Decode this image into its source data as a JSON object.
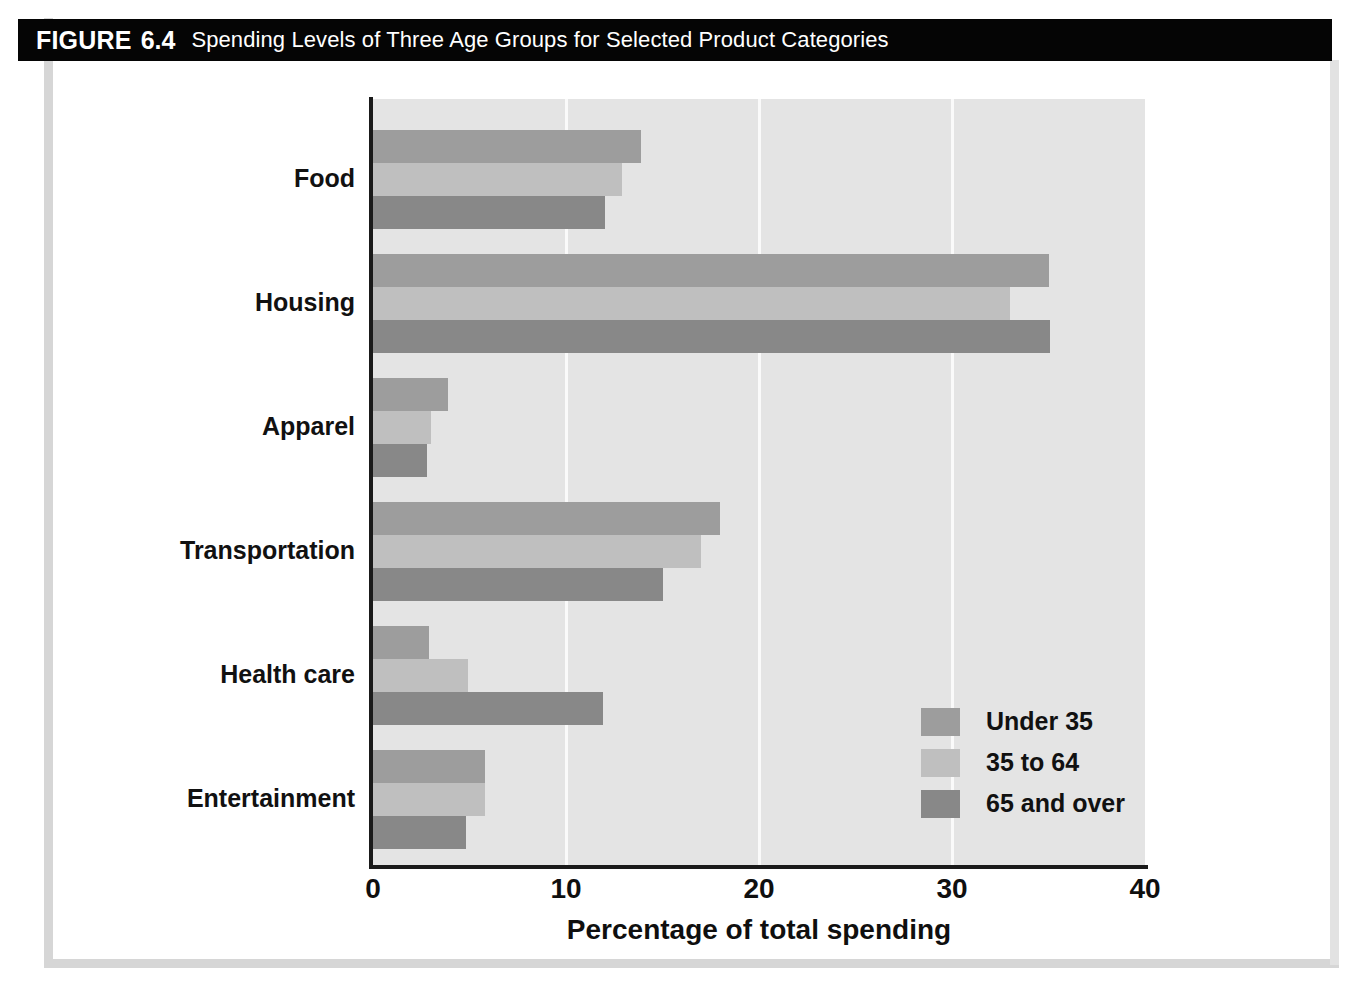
{
  "figure": {
    "label": "FIGURE",
    "number": "6.4",
    "caption": "Spending Levels of Three Age Groups for Selected Product Categories"
  },
  "chart_data": {
    "type": "bar",
    "orientation": "horizontal",
    "title": "Spending Levels of Three Age Groups for Selected Product Categories",
    "xlabel": "Percentage of total spending",
    "ylabel": "",
    "xlim": [
      0,
      40
    ],
    "xticks": [
      0,
      10,
      20,
      30,
      40
    ],
    "xticklabels": [
      "0",
      "10",
      "20",
      "30",
      "40"
    ],
    "grid": "vertical",
    "legend_position": "inside-lower-right",
    "categories": [
      "Food",
      "Housing",
      "Apparel",
      "Transportation",
      "Health care",
      "Entertainment"
    ],
    "series": [
      {
        "name": "Under 35",
        "color": "#9d9d9d",
        "values": [
          13.9,
          35.0,
          3.9,
          18.0,
          2.9,
          5.8
        ]
      },
      {
        "name": "35 to 64",
        "color": "#bfbfbf",
        "values": [
          12.9,
          33.0,
          3.0,
          17.0,
          4.9,
          5.8
        ]
      },
      {
        "name": "65 and over",
        "color": "#888888",
        "values": [
          12.0,
          35.1,
          2.8,
          15.0,
          11.9,
          4.8
        ]
      }
    ]
  },
  "legend": {
    "items": [
      {
        "label": "Under 35",
        "color": "#9d9d9d"
      },
      {
        "label": "35 to 64",
        "color": "#bfbfbf"
      },
      {
        "label": "65 and over",
        "color": "#888888"
      }
    ]
  },
  "colors": {
    "plot_background": "#e4e4e4",
    "gridline": "#fafafa",
    "axis": "#1a1a1a",
    "banner": "#050505",
    "banner_text": "#ffffff",
    "frame": "#d6d6d6"
  }
}
